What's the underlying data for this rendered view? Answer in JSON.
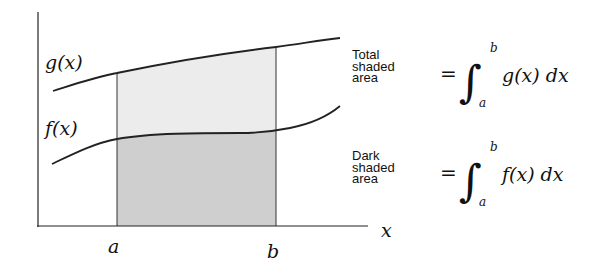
{
  "diagram": {
    "curves": {
      "upper": {
        "label": "g(x)"
      },
      "lower": {
        "label": "f(x)"
      }
    },
    "axes": {
      "x_label": "x",
      "a_label": "a",
      "b_label": "b"
    },
    "colors": {
      "light_shade": "#ececec",
      "dark_shade": "#cfcfcf",
      "stroke": "#222222"
    },
    "equations": [
      {
        "description_lines": [
          "Total",
          "shaded",
          "area"
        ],
        "equals": "=",
        "integral": "∫",
        "upper_limit": "b",
        "lower_limit": "a",
        "integrand": "g(x) dx"
      },
      {
        "description_lines": [
          "Dark",
          "shaded",
          "area"
        ],
        "equals": "=",
        "integral": "∫",
        "upper_limit": "b",
        "lower_limit": "a",
        "integrand": "f(x) dx"
      }
    ]
  }
}
